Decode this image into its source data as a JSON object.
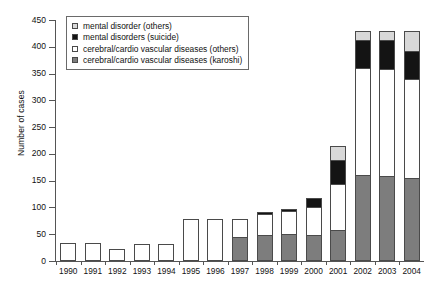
{
  "chart_data": {
    "type": "bar",
    "stacked": true,
    "title": "",
    "xlabel": "",
    "ylabel": "Number of cases",
    "ylim": [
      0,
      450
    ],
    "ytick_step": 50,
    "yticks": [
      0,
      50,
      100,
      150,
      200,
      250,
      300,
      350,
      400,
      450
    ],
    "grid": false,
    "legend_position": "top-left-inside",
    "categories": [
      "1990",
      "1991",
      "1992",
      "1993",
      "1994",
      "1995",
      "1996",
      "1997",
      "1998",
      "1999",
      "2000",
      "2001",
      "2002",
      "2003",
      "2004"
    ],
    "series": [
      {
        "name": "cerebral/cardio vascular diseases (karoshi)",
        "color": "#7d7d7d",
        "values": [
          0,
          0,
          0,
          0,
          0,
          0,
          0,
          45,
          48,
          50,
          48,
          58,
          160,
          158,
          155
        ]
      },
      {
        "name": "cerebral/cardio vascular diseases (others)",
        "color": "#ffffff",
        "values": [
          33,
          33,
          22,
          32,
          32,
          78,
          78,
          33,
          40,
          43,
          52,
          85,
          200,
          200,
          185
        ]
      },
      {
        "name": "mental disorders (suicide)",
        "color": "#141414",
        "values": [
          0,
          0,
          0,
          0,
          0,
          0,
          0,
          0,
          3,
          5,
          18,
          45,
          53,
          55,
          53
        ]
      },
      {
        "name": "mental disorder (others)",
        "color": "#d8d8d8",
        "values": [
          0,
          0,
          0,
          0,
          0,
          0,
          0,
          0,
          0,
          0,
          0,
          27,
          17,
          17,
          37
        ]
      }
    ],
    "totals": [
      33,
      33,
      22,
      32,
      32,
      78,
      78,
      78,
      91,
      98,
      118,
      215,
      430,
      430,
      430
    ]
  },
  "legend": {
    "entries": [
      {
        "label": "mental disorder (others)",
        "swatch": "md-others"
      },
      {
        "label": "mental disorders (suicide)",
        "swatch": "md-suicide"
      },
      {
        "label": "cerebral/cardio vascular diseases (others)",
        "swatch": "cv-others"
      },
      {
        "label": "cerebral/cardio vascular diseases (karoshi)",
        "swatch": "karoshi"
      }
    ]
  }
}
